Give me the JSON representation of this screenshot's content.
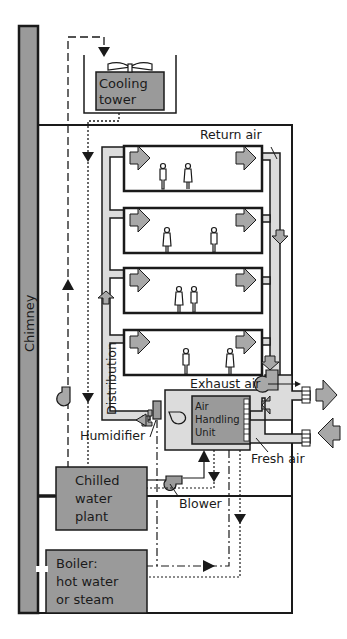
{
  "diagram": {
    "type": "building HVAC system schematic",
    "colors": {
      "equipment_fill": "#9a9a9a",
      "duct_fill": "#dcdcdc",
      "arrow_fill": "#a8a8a8",
      "line": "#1a1a1a",
      "background": "#ffffff"
    },
    "labels": {
      "chimney": "Chimney",
      "cooling_tower_line1": "Cooling",
      "cooling_tower_line2": "tower",
      "return_air": "Return air",
      "distribution": "Distribution",
      "exhaust_air": "Exhaust air",
      "fresh_air": "Fresh air",
      "humidifier": "Humidifier",
      "ahu_line1": "Air",
      "ahu_line2": "Handling",
      "ahu_line3": "Unit",
      "chilled_line1": "Chilled",
      "chilled_line2": "water",
      "chilled_line3": "plant",
      "blower": "Blower",
      "boiler_line1": "Boiler:",
      "boiler_line2": "hot water",
      "boiler_line3": "or steam"
    },
    "floors": [
      {
        "index": 1,
        "occupants": 2
      },
      {
        "index": 2,
        "occupants": 2
      },
      {
        "index": 3,
        "occupants": 2
      },
      {
        "index": 4,
        "occupants": 2
      }
    ],
    "line_legend": {
      "dashed": "condenser / hot water loop",
      "dotted": "chilled / return water loop",
      "dash_dot": "heating supply loop"
    }
  }
}
